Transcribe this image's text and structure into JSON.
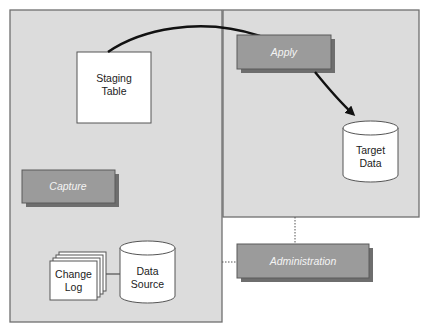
{
  "diagram": {
    "type": "architecture-diagram",
    "panels": [
      {
        "id": "source-panel",
        "label": ""
      },
      {
        "id": "target-panel",
        "label": ""
      }
    ],
    "processes": {
      "capture": {
        "label": "Capture"
      },
      "apply": {
        "label": "Apply"
      },
      "administration": {
        "label": "Administration"
      }
    },
    "objects": {
      "staging_table": {
        "line1": "Staging",
        "line2": "Table"
      },
      "change_log": {
        "line1": "Change",
        "line2": "Log"
      },
      "data_source": {
        "line1": "Data",
        "line2": "Source"
      },
      "target_data": {
        "line1": "Target",
        "line2": "Data"
      }
    },
    "edges": [
      {
        "from": "staging_table",
        "to": "apply",
        "style": "solid-thick"
      },
      {
        "from": "apply",
        "to": "target_data",
        "style": "arrow"
      },
      {
        "from": "change_log",
        "to": "data_source",
        "style": "solid-thin"
      },
      {
        "from": "target-panel",
        "to": "administration",
        "style": "dotted"
      },
      {
        "from": "source-panel",
        "to": "administration",
        "style": "dotted"
      }
    ],
    "colors": {
      "panel_fill": "#dcdcdc",
      "process_fill": "#9b9b9b",
      "process_shadow": "#6e6e6e",
      "process_text": "#f4f4f4",
      "object_fill": "#ffffff"
    }
  }
}
